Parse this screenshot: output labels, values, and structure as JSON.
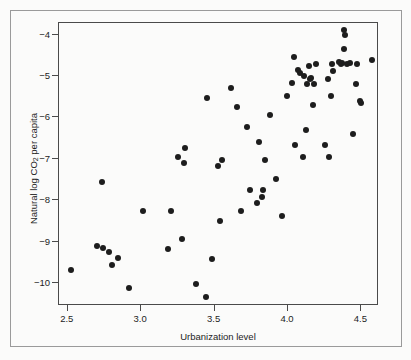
{
  "chart_data": {
    "type": "scatter",
    "title": "",
    "xlabel": "Urbanization level",
    "ylabel_prefix": "Natural log CO",
    "ylabel_sub": "2",
    "ylabel_suffix": " per capita",
    "ylabel_full": "Natural log CO2 per capita",
    "xlim": [
      2.44,
      4.62
    ],
    "ylim": [
      -10.55,
      -3.72
    ],
    "xticks": [
      "2.5",
      "3.0",
      "3.5",
      "4.0",
      "4.5"
    ],
    "xtick_values": [
      2.5,
      3.0,
      3.5,
      4.0,
      4.5
    ],
    "yticks": [
      "−4",
      "−5",
      "−6",
      "−7",
      "−8",
      "−9",
      "−10"
    ],
    "ytick_values": [
      -4,
      -5,
      -6,
      -7,
      -8,
      -9,
      -10
    ],
    "grid": false,
    "legend": null,
    "marker": {
      "shape": "circle",
      "color": "#1d1d1d",
      "size_px": 6
    },
    "points": [
      [
        2.52,
        -9.67
      ],
      [
        2.7,
        -9.09
      ],
      [
        2.73,
        -7.55
      ],
      [
        2.74,
        -9.15
      ],
      [
        2.78,
        -9.25
      ],
      [
        2.8,
        -9.56
      ],
      [
        2.84,
        -9.4
      ],
      [
        2.92,
        -10.12
      ],
      [
        3.01,
        -8.26
      ],
      [
        3.18,
        -9.18
      ],
      [
        3.2,
        -8.26
      ],
      [
        3.25,
        -6.96
      ],
      [
        3.28,
        -8.93
      ],
      [
        3.29,
        -7.09
      ],
      [
        3.3,
        -6.74
      ],
      [
        3.37,
        -10.03
      ],
      [
        3.44,
        -10.33
      ],
      [
        3.45,
        -5.53
      ],
      [
        3.48,
        -9.42
      ],
      [
        3.52,
        -7.17
      ],
      [
        3.54,
        -8.5
      ],
      [
        3.55,
        -7.02
      ],
      [
        3.61,
        -5.29
      ],
      [
        3.65,
        -5.74
      ],
      [
        3.68,
        -8.25
      ],
      [
        3.72,
        -6.23
      ],
      [
        3.74,
        -7.74
      ],
      [
        3.79,
        -8.06
      ],
      [
        3.8,
        -6.58
      ],
      [
        3.82,
        -7.92
      ],
      [
        3.83,
        -7.76
      ],
      [
        3.84,
        -7.02
      ],
      [
        3.88,
        -5.94
      ],
      [
        3.92,
        -7.48
      ],
      [
        3.96,
        -8.38
      ],
      [
        3.99,
        -5.49
      ],
      [
        4.03,
        -5.18
      ],
      [
        4.04,
        -4.54
      ],
      [
        4.05,
        -6.66
      ],
      [
        4.07,
        -4.85
      ],
      [
        4.08,
        -4.92
      ],
      [
        4.1,
        -6.96
      ],
      [
        4.11,
        -4.99
      ],
      [
        4.12,
        -6.3
      ],
      [
        4.13,
        -5.2
      ],
      [
        4.14,
        -4.76
      ],
      [
        4.15,
        -5.08
      ],
      [
        4.16,
        -5.04
      ],
      [
        4.17,
        -5.7
      ],
      [
        4.18,
        -5.19
      ],
      [
        4.19,
        -4.72
      ],
      [
        4.25,
        -6.66
      ],
      [
        4.27,
        -5.06
      ],
      [
        4.28,
        -6.96
      ],
      [
        4.29,
        -5.49
      ],
      [
        4.3,
        -4.71
      ],
      [
        4.31,
        -4.88
      ],
      [
        4.35,
        -4.66
      ],
      [
        4.36,
        -4.71
      ],
      [
        4.37,
        -4.69
      ],
      [
        4.38,
        -3.88
      ],
      [
        4.38,
        -4.34
      ],
      [
        4.39,
        -4.02
      ],
      [
        4.4,
        -4.71
      ],
      [
        4.42,
        -4.68
      ],
      [
        4.44,
        -6.4
      ],
      [
        4.46,
        -5.19
      ],
      [
        4.47,
        -4.7
      ],
      [
        4.49,
        -5.6
      ],
      [
        4.5,
        -5.65
      ],
      [
        4.57,
        -4.62
      ]
    ]
  }
}
